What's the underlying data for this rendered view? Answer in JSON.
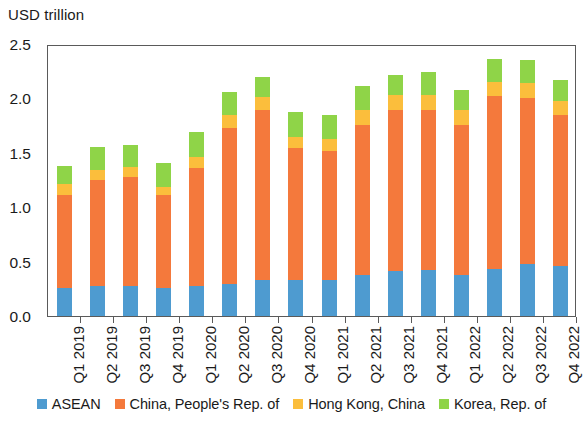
{
  "chart_data": {
    "type": "bar",
    "stacked": true,
    "title": "",
    "ylabel": "USD trillion",
    "xlabel": "",
    "ylim": [
      0.0,
      2.5
    ],
    "ytick_labels": [
      "2.5",
      "2.0",
      "1.5",
      "1.0",
      "0.5",
      "0.0"
    ],
    "ytick_values": [
      2.5,
      2.0,
      1.5,
      1.0,
      0.5,
      0.0
    ],
    "grid": false,
    "legend_position": "bottom",
    "categories": [
      "Q1 2019",
      "Q2 2019",
      "Q3 2019",
      "Q4 2019",
      "Q1 2020",
      "Q2 2020",
      "Q3 2020",
      "Q4 2020",
      "Q1 2021",
      "Q2 2021",
      "Q3 2021",
      "Q4 2021",
      "Q1 2022",
      "Q2 2022",
      "Q3 2022",
      "Q4 2022"
    ],
    "series": [
      {
        "name": "ASEAN",
        "color": "#4E9BD0",
        "values": [
          0.26,
          0.28,
          0.28,
          0.26,
          0.28,
          0.29,
          0.33,
          0.33,
          0.33,
          0.38,
          0.41,
          0.42,
          0.38,
          0.43,
          0.48,
          0.46
        ]
      },
      {
        "name": "China, People's Rep. of",
        "color": "#F4793C",
        "values": [
          0.85,
          0.97,
          1.0,
          0.85,
          1.08,
          1.44,
          1.56,
          1.21,
          1.19,
          1.38,
          1.48,
          1.47,
          1.38,
          1.59,
          1.52,
          1.39
        ]
      },
      {
        "name": "Hong Kong, China",
        "color": "#FBBE3C",
        "values": [
          0.1,
          0.09,
          0.09,
          0.08,
          0.1,
          0.12,
          0.12,
          0.11,
          0.11,
          0.13,
          0.14,
          0.14,
          0.13,
          0.13,
          0.14,
          0.13
        ]
      },
      {
        "name": "Korea, Rep. of",
        "color": "#8FD448",
        "values": [
          0.17,
          0.21,
          0.2,
          0.22,
          0.23,
          0.21,
          0.19,
          0.23,
          0.22,
          0.22,
          0.19,
          0.21,
          0.19,
          0.21,
          0.21,
          0.19
        ]
      }
    ],
    "totals": [
      1.38,
      1.55,
      1.57,
      1.41,
      1.69,
      2.06,
      2.2,
      1.88,
      1.85,
      2.11,
      2.22,
      2.24,
      2.08,
      2.36,
      2.35,
      2.17
    ]
  },
  "legend": {
    "items": [
      {
        "label": "ASEAN",
        "color": "#4E9BD0"
      },
      {
        "label": "China, People's Rep. of",
        "color": "#F4793C"
      },
      {
        "label": "Hong Kong, China",
        "color": "#FBBE3C"
      },
      {
        "label": "Korea, Rep. of",
        "color": "#8FD448"
      }
    ]
  },
  "axis": {
    "unit_title": "USD trillion"
  }
}
